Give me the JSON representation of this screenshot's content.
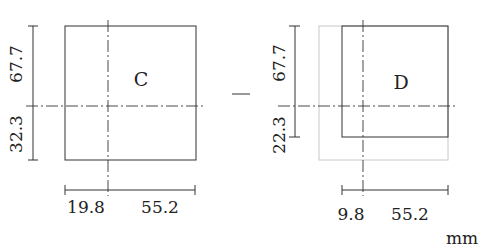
{
  "diagram": {
    "unit": "mm",
    "colors": {
      "line": "#333333",
      "ghost": "#c8c8c8",
      "text": "#222222"
    },
    "panels": [
      {
        "id": "C",
        "label": "C",
        "dim_top": "67.7",
        "dim_bottom": "32.3",
        "dim_left": "19.8",
        "dim_right": "55.2"
      },
      {
        "id": "D",
        "label": "D",
        "dim_top": "67.7",
        "dim_bottom": "22.3",
        "dim_left": "9.8",
        "dim_right": "55.2"
      }
    ]
  }
}
